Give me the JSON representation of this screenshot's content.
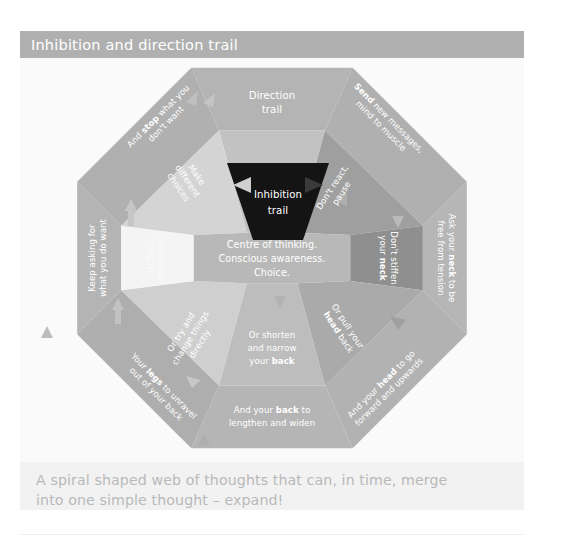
{
  "header": {
    "title": "Inhibition and direction trail"
  },
  "caption": {
    "line1": "A spiral shaped web of thoughts that can, in time, merge",
    "line2": "into one simple thought – expand!"
  },
  "diagram": {
    "center": {
      "line1": "Centre of thinking.",
      "line2": "Conscious awareness.",
      "line3": "Choice."
    },
    "trails": {
      "direction_line1": "Direction",
      "direction_line2": "trail",
      "inhibition_line1": "Inhibition",
      "inhibition_line2": "trail"
    },
    "inner_ring": [
      {
        "id": "make-different-choices",
        "text_plain": "Make different choices",
        "line1": "Make",
        "line2": "different",
        "line3": "choices"
      },
      {
        "id": "dont-react-pause",
        "text_plain": "Don't react, pause",
        "line1": "Don't react,",
        "line2": "pause"
      },
      {
        "id": "dont-stiffen-your-neck",
        "text_plain": "Don't stiffen your neck",
        "line1": "Don't stiffen",
        "line2_pre": "your ",
        "line2_bold": "neck"
      },
      {
        "id": "or-pull-your-head-back",
        "text_plain": "Or pull your head back",
        "line1": "Or pull your",
        "line2_bold": "head",
        "line2_post": " back"
      },
      {
        "id": "or-shorten-and-narrow-your-back",
        "text_plain": "Or shorten and narrow your back",
        "line1": "Or shorten",
        "line2": "and narrow",
        "line3_pre": "your ",
        "line3_bold": "back"
      },
      {
        "id": "or-try-and-change-things-directly",
        "text_plain": "Or try and change things directly",
        "line1": "Or try and",
        "line2": "change things",
        "line3": "directly"
      },
      {
        "id": "or-feel-things-out",
        "text_plain": "Or feel things out",
        "line1": "Or feel",
        "line2": "things out"
      },
      {
        "id": "inhibition-trail-wedge",
        "text_plain": "Inhibition trail"
      }
    ],
    "outer_ring": [
      {
        "id": "and-stop-what-you-dont-want",
        "text_plain": "And stop what you don't want",
        "line1_pre": "And ",
        "line1_bold": "stop",
        "line1_post": " what you",
        "line2": "don't want"
      },
      {
        "id": "send-new-messages-mind-to-muscle",
        "text_plain": "Send new messages, mind to muscle",
        "line1_bold": "Send",
        "line1_post": " new messages,",
        "line2": "mind to muscle"
      },
      {
        "id": "ask-your-neck-to-be-free-from-tension",
        "text_plain": "Ask your neck to be free from tension",
        "line1_pre": "Ask your ",
        "line1_bold": "neck",
        "line1_post": " to be",
        "line2": "free from tension"
      },
      {
        "id": "and-your-head-to-go-forward-and-upwards",
        "text_plain": "And your head to go forward and upwards",
        "line1_pre": "And your ",
        "line1_bold": "head",
        "line1_post": " to go",
        "line2": "forward and upwards"
      },
      {
        "id": "and-your-back-to-lengthen-and-widen",
        "text_plain": "And your back to lengthen and widen",
        "line1_pre": "And your ",
        "line1_bold": "back",
        "line1_post": " to",
        "line2": "lengthen and widen"
      },
      {
        "id": "your-legs-to-unravel-out-of-your-back",
        "text_plain": "Your legs to unravel out of your back",
        "line1_pre": "Your ",
        "line1_bold": "legs",
        "line1_post": " to unravel",
        "line2": "out of your back"
      },
      {
        "id": "keep-asking-for-what-you-do-want",
        "text_plain": "Keep asking for what you do want",
        "line1": "Keep asking for",
        "line2": "what you do want"
      }
    ],
    "colors": {
      "page_background": "#ffffff",
      "title_bar": "#b0b0b0",
      "panel_background": "#fafafa",
      "caption_background": "#f2f2f2",
      "caption_text": "#b9b9b9",
      "outer_ring_default": "#b4b4b4",
      "outer_ring_alt": "#acacac",
      "inner_ring_light": "#c9c9c9",
      "inner_ring_mid": "#bdbdbd",
      "inner_ring_dark": "#8f8f8f",
      "inner_ring_white": "#f4f4f4",
      "center_octagon": "#b8b8b8",
      "inhibition_wedge": "#111111",
      "label_text": "#ffffff"
    }
  }
}
